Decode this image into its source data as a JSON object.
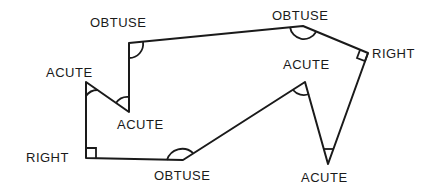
{
  "diagram": {
    "type": "polygon-angle-classification",
    "vertices": [
      {
        "id": "v1",
        "label": "OBTUSE",
        "kind": "obtuse"
      },
      {
        "id": "v2",
        "label": "OBTUSE",
        "kind": "obtuse"
      },
      {
        "id": "v3",
        "label": "RIGHT",
        "kind": "right"
      },
      {
        "id": "v4",
        "label": "ACUTE",
        "kind": "acute"
      },
      {
        "id": "v5",
        "label": "ACUTE",
        "kind": "acute"
      },
      {
        "id": "v6",
        "label": "ACUTE",
        "kind": "acute"
      },
      {
        "id": "v7",
        "label": "OBTUSE",
        "kind": "obtuse"
      },
      {
        "id": "v8",
        "label": "RIGHT",
        "kind": "right"
      },
      {
        "id": "v9",
        "label": "ACUTE",
        "kind": "acute"
      }
    ]
  }
}
